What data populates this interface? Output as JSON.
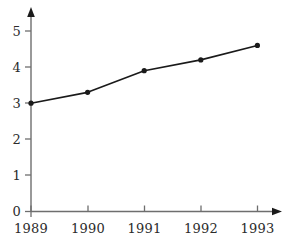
{
  "chart_data": {
    "type": "line",
    "title": "",
    "subtitle": "",
    "xlabel": "",
    "ylabel": "",
    "categories": [
      "1989",
      "1990",
      "1991",
      "1992",
      "1993"
    ],
    "x": [
      1989,
      1990,
      1991,
      1992,
      1993
    ],
    "values": [
      3.0,
      3.3,
      3.9,
      4.2,
      4.6
    ],
    "series": [
      {
        "name": "",
        "values": [
          3.0,
          3.3,
          3.9,
          4.2,
          4.6
        ]
      }
    ],
    "xlim": [
      1989,
      1993
    ],
    "ylim": [
      0,
      5.4
    ],
    "y_ticks": [
      0,
      1,
      2,
      3,
      4,
      5
    ],
    "y_tick_labels": [
      "0",
      "1",
      "2",
      "3",
      "4",
      "5"
    ],
    "x_ticks": [
      1989,
      1990,
      1991,
      1992,
      1993
    ],
    "x_tick_labels": [
      "1989",
      "1990",
      "1991",
      "1992",
      "1993"
    ],
    "grid": false,
    "legend": false,
    "legend_position": "none",
    "markers": "filled-circle",
    "line_color": "#1a1a1a",
    "marker_color": "#1a1a1a",
    "axis_color": "#6e6e6e",
    "background_color": "#ffffff",
    "axis_arrows": true,
    "annotations": []
  },
  "axes": {
    "y_labels": [
      "5",
      "4",
      "3",
      "2",
      "1",
      "0"
    ],
    "x_labels": [
      "1989",
      "1990",
      "1991",
      "1992",
      "1993"
    ]
  }
}
